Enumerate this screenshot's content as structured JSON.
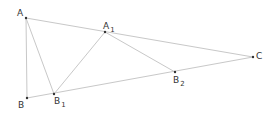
{
  "diagram": {
    "type": "geometry",
    "line_color": "#c8c8c8",
    "point_color": "#333333",
    "points": [
      {
        "id": "A",
        "label": "A",
        "subscript": "",
        "x": 26,
        "y": 18,
        "lx": 17,
        "ly": 16
      },
      {
        "id": "B",
        "label": "B",
        "subscript": "",
        "x": 27,
        "y": 98,
        "lx": 18,
        "ly": 108
      },
      {
        "id": "B1",
        "label": "B",
        "subscript": "1",
        "x": 54,
        "y": 94,
        "lx": 54,
        "ly": 104
      },
      {
        "id": "A1",
        "label": "A",
        "subscript": "1",
        "x": 105,
        "y": 32,
        "lx": 103,
        "ly": 29
      },
      {
        "id": "B2",
        "label": "B",
        "subscript": "2",
        "x": 175,
        "y": 72,
        "lx": 173,
        "ly": 83
      },
      {
        "id": "C",
        "label": "C",
        "subscript": "",
        "x": 253,
        "y": 57,
        "lx": 256,
        "ly": 59
      }
    ],
    "segments": [
      [
        "A",
        "B"
      ],
      [
        "A",
        "B1"
      ],
      [
        "A",
        "C"
      ],
      [
        "B",
        "C"
      ],
      [
        "B1",
        "A1"
      ],
      [
        "A1",
        "B2"
      ]
    ]
  }
}
